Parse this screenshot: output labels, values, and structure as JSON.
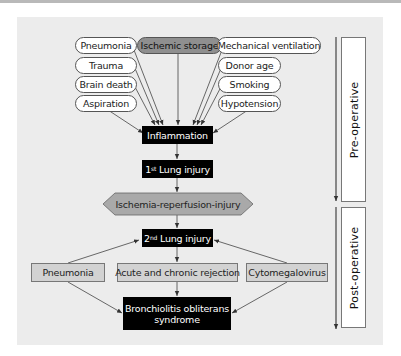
{
  "diagram": {
    "risk_factors_left": [
      "Pneumonia",
      "Trauma",
      "Brain death",
      "Aspiration"
    ],
    "risk_factor_center": "Ischemic storage",
    "risk_factors_right": [
      "Mechanical ventilation",
      "Donor age",
      "Smoking",
      "Hypotension"
    ],
    "inflammation": "Inflammation",
    "first_injury": {
      "ordinal": "1",
      "suffix": "st",
      "label": " Lung injury"
    },
    "ischemia": "Ischemia-reperfusion-injury",
    "second_injury": {
      "ordinal": "2",
      "suffix": "nd",
      "label": " Lung injury"
    },
    "post_factors": [
      "Pneumonia",
      "Acute and chronic rejection",
      "Cytomegalovirus"
    ],
    "outcome": [
      "Bronchiolitis obliterans",
      "syndrome"
    ],
    "phases": {
      "pre": "Pre-operative",
      "post": "Post-operative"
    }
  },
  "colors": {
    "panel_bg": "#ececec",
    "black_node": "#000000",
    "gray_node": "#d2d2d2",
    "ischemic_node": "#8f8f8f",
    "hexagon": "#a9a9a9"
  }
}
